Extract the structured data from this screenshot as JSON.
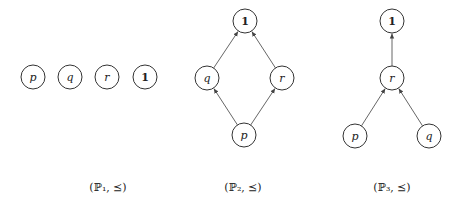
{
  "diagrams": [
    {
      "id": "P1",
      "caption": "(ℙ₁, ⪯)",
      "caption_pos": [
        108,
        191
      ],
      "nodes": [
        {
          "id": "p",
          "label": "p",
          "x": 33,
          "y": 77,
          "bold": false
        },
        {
          "id": "q",
          "label": "q",
          "x": 70,
          "y": 77,
          "bold": false
        },
        {
          "id": "r",
          "label": "r",
          "x": 107,
          "y": 77,
          "bold": false
        },
        {
          "id": "one",
          "label": "1",
          "x": 145,
          "y": 77,
          "bold": true
        }
      ],
      "edges": []
    },
    {
      "id": "P2",
      "caption": "(ℙ₂, ⪯)",
      "caption_pos": [
        243,
        191
      ],
      "nodes": [
        {
          "id": "one",
          "label": "1",
          "x": 245,
          "y": 21,
          "bold": true
        },
        {
          "id": "q",
          "label": "q",
          "x": 207,
          "y": 78,
          "bold": false
        },
        {
          "id": "r",
          "label": "r",
          "x": 282,
          "y": 78,
          "bold": false
        },
        {
          "id": "p",
          "label": "p",
          "x": 244,
          "y": 135,
          "bold": false
        }
      ],
      "edges": [
        {
          "from": "q",
          "to": "one"
        },
        {
          "from": "r",
          "to": "one"
        },
        {
          "from": "p",
          "to": "q"
        },
        {
          "from": "p",
          "to": "r"
        }
      ]
    },
    {
      "id": "P3",
      "caption": "(ℙ₃, ⪯)",
      "caption_pos": [
        392,
        191
      ],
      "nodes": [
        {
          "id": "one",
          "label": "1",
          "x": 392,
          "y": 21,
          "bold": true
        },
        {
          "id": "r",
          "label": "r",
          "x": 392,
          "y": 78,
          "bold": false
        },
        {
          "id": "p",
          "label": "p",
          "x": 355,
          "y": 136,
          "bold": false
        },
        {
          "id": "q",
          "label": "q",
          "x": 429,
          "y": 136,
          "bold": false
        }
      ],
      "edges": [
        {
          "from": "r",
          "to": "one"
        },
        {
          "from": "p",
          "to": "r"
        },
        {
          "from": "q",
          "to": "r"
        }
      ]
    }
  ],
  "style": {
    "node_radius": 12,
    "stroke_color": "#333333",
    "edge_color": "#555555"
  }
}
